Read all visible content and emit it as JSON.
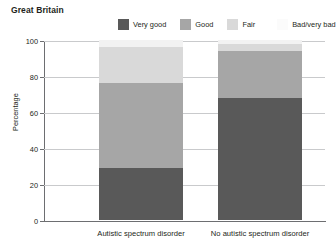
{
  "title": "Great Britain",
  "chart_data": {
    "type": "bar",
    "subtype": "stacked-column",
    "title": "Great Britain",
    "xlabel": "",
    "ylabel": "Percentage",
    "ylim": [
      0,
      100
    ],
    "yticks": [
      0,
      20,
      40,
      60,
      80,
      100
    ],
    "ytick_labels": [
      "0",
      "20",
      "40",
      "60",
      "80",
      "100"
    ],
    "grid": true,
    "legend_position": "top-right",
    "categories": [
      "Autistic spectrum disorder",
      "No autistic spectrum disorder"
    ],
    "series": [
      {
        "name": "Very good",
        "color": "#595959",
        "values": [
          29,
          68
        ]
      },
      {
        "name": "Good",
        "color": "#a6a6a6",
        "values": [
          47,
          26
        ]
      },
      {
        "name": "Fair",
        "color": "#d9d9d9",
        "values": [
          20,
          4
        ]
      },
      {
        "name": "Bad/very bad",
        "color": "#f2f2f2",
        "values": [
          4,
          2
        ]
      }
    ]
  },
  "legend": {
    "items": [
      {
        "label": "Very good",
        "color": "#595959"
      },
      {
        "label": "Good",
        "color": "#a6a6a6"
      },
      {
        "label": "Fair",
        "color": "#d9d9d9"
      },
      {
        "label": "Bad/very bad",
        "color": "#fbfbfb"
      }
    ]
  },
  "axis": {
    "y_label": "Percentage",
    "y_ticks": [
      "100",
      "80",
      "60",
      "40",
      "20",
      "0"
    ]
  },
  "categories": [
    {
      "label": "Autistic spectrum disorder"
    },
    {
      "label": "No autistic spectrum disorder"
    }
  ]
}
